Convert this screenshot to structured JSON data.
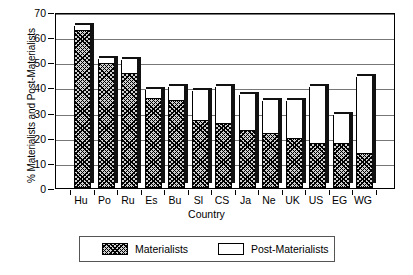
{
  "chart_data": {
    "type": "bar",
    "stacked": true,
    "title": "",
    "xlabel": "Country",
    "ylabel": "% Materialists and Post-Materialists",
    "ylim": [
      0,
      70
    ],
    "ytick_step": 10,
    "yticks": [
      0,
      10,
      20,
      30,
      40,
      50,
      60,
      70
    ],
    "grid": true,
    "legend_position": "bottom",
    "categories": [
      "Hu",
      "Po",
      "Ru",
      "Es",
      "Bu",
      "Sl",
      "CS",
      "Ja",
      "Ne",
      "UK",
      "US",
      "EG",
      "WG"
    ],
    "series": [
      {
        "name": "Materialists",
        "values": [
          62.5,
          49.5,
          45.5,
          35.5,
          34.5,
          26.5,
          25.5,
          22.5,
          21.5,
          19.5,
          17.5,
          17.5,
          13.5
        ]
      },
      {
        "name": "Post-Materialists",
        "values": [
          2.0,
          2.0,
          5.5,
          3.5,
          5.5,
          12.0,
          14.5,
          14.5,
          13.0,
          15.0,
          22.5,
          11.5,
          30.5
        ]
      }
    ],
    "totals": [
      64.5,
      51.5,
      51.0,
      39.0,
      40.0,
      38.5,
      40.0,
      37.0,
      34.5,
      34.5,
      40.0,
      29.0,
      44.0
    ]
  },
  "legend": {
    "items": [
      {
        "label": "Materialists",
        "pattern": "hatched"
      },
      {
        "label": "Post-Materialists",
        "pattern": "white"
      }
    ]
  },
  "colors": {
    "axis": "#000000",
    "grid": "#777777",
    "bar_fill_post": "#ffffff",
    "bar_edge": "#000000",
    "bar_shadow": "#111111",
    "background": "#ffffff"
  }
}
